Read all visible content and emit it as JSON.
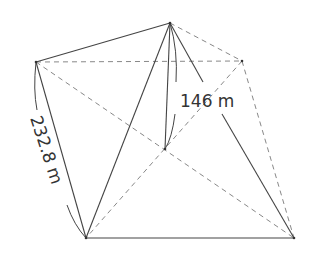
{
  "diagram": {
    "type": "square-pyramid",
    "colors": {
      "solid": "#444444",
      "dashed": "#888888",
      "text": "#333333"
    },
    "vertices": {
      "apex": [
        170,
        23
      ],
      "left_back": [
        36,
        62
      ],
      "right_back": [
        242,
        61
      ],
      "bottom_left": [
        86,
        238
      ],
      "bottom_right": [
        294,
        238
      ],
      "base_center": [
        165,
        149
      ]
    },
    "labels": {
      "height": "146 m",
      "base_edge": "232.8 m"
    }
  }
}
